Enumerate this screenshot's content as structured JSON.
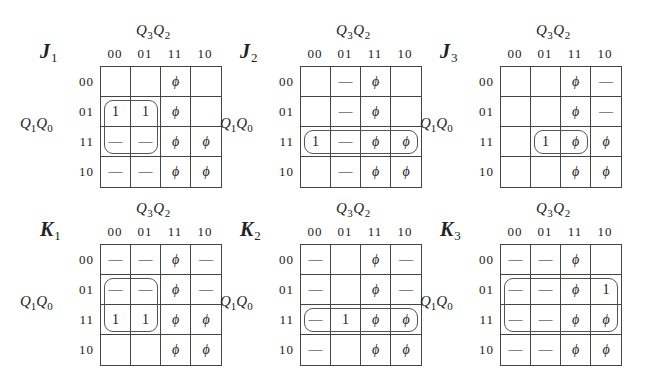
{
  "diagram": {
    "type": "karnaugh-maps",
    "col_variables": "Q3Q2",
    "row_variables": "Q1Q0",
    "col_labels": [
      "00",
      "01",
      "11",
      "10"
    ],
    "row_labels": [
      "00",
      "01",
      "11",
      "10"
    ],
    "symbols": {
      "one": "1",
      "dont_care_unused": "ϕ",
      "dont_care": "—",
      "zero": ""
    }
  },
  "maps": [
    {
      "name": "J",
      "sub": "1",
      "cells": [
        [
          "",
          "",
          "ϕ",
          ""
        ],
        [
          "1",
          "1",
          "ϕ",
          ""
        ],
        [
          "—",
          "—",
          "ϕ",
          "ϕ"
        ],
        [
          "—",
          "—",
          "ϕ",
          "ϕ"
        ]
      ],
      "loops": [
        {
          "row": 1,
          "col": 0,
          "rows": 2,
          "cols": 2
        }
      ]
    },
    {
      "name": "J",
      "sub": "2",
      "cells": [
        [
          "",
          "—",
          "ϕ",
          ""
        ],
        [
          "",
          "—",
          "ϕ",
          ""
        ],
        [
          "1",
          "—",
          "ϕ",
          "ϕ"
        ],
        [
          "",
          "—",
          "ϕ",
          "ϕ"
        ]
      ],
      "loops": [
        {
          "row": 2,
          "col": 0,
          "rows": 1,
          "cols": 4
        }
      ]
    },
    {
      "name": "J",
      "sub": "3",
      "cells": [
        [
          "",
          "",
          "ϕ",
          "—"
        ],
        [
          "",
          "",
          "ϕ",
          "—"
        ],
        [
          "",
          "1",
          "ϕ",
          "ϕ"
        ],
        [
          "",
          "",
          "ϕ",
          "ϕ"
        ]
      ],
      "loops": [
        {
          "row": 2,
          "col": 1,
          "rows": 1,
          "cols": 2
        }
      ]
    },
    {
      "name": "K",
      "sub": "1",
      "cells": [
        [
          "—",
          "—",
          "ϕ",
          "—"
        ],
        [
          "—",
          "—",
          "ϕ",
          "—"
        ],
        [
          "1",
          "1",
          "ϕ",
          "ϕ"
        ],
        [
          "",
          "",
          "ϕ",
          "ϕ"
        ]
      ],
      "loops": [
        {
          "row": 1,
          "col": 0,
          "rows": 2,
          "cols": 2
        }
      ]
    },
    {
      "name": "K",
      "sub": "2",
      "cells": [
        [
          "—",
          "",
          "ϕ",
          "—"
        ],
        [
          "—",
          "",
          "ϕ",
          "—"
        ],
        [
          "—",
          "1",
          "ϕ",
          "ϕ"
        ],
        [
          "—",
          "",
          "ϕ",
          "ϕ"
        ]
      ],
      "loops": [
        {
          "row": 2,
          "col": 0,
          "rows": 1,
          "cols": 4
        }
      ]
    },
    {
      "name": "K",
      "sub": "3",
      "cells": [
        [
          "—",
          "—",
          "ϕ",
          ""
        ],
        [
          "—",
          "—",
          "ϕ",
          "1"
        ],
        [
          "—",
          "—",
          "ϕ",
          "ϕ"
        ],
        [
          "—",
          "—",
          "ϕ",
          "ϕ"
        ]
      ],
      "loops": [
        {
          "row": 1,
          "col": 0,
          "rows": 2,
          "cols": 4
        }
      ]
    }
  ]
}
